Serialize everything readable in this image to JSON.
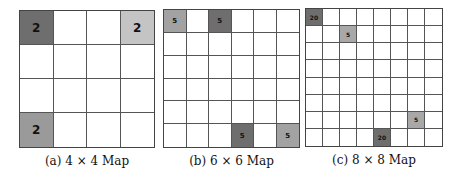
{
  "panels": [
    {
      "id": "a",
      "caption": "(a) 4 × 4 Map",
      "size": 4,
      "box": {
        "x": 19,
        "y": 10,
        "w": 136,
        "h": 138
      },
      "font_size": 12,
      "cells": [
        {
          "row": 0,
          "col": 0,
          "value": "2",
          "color": "#6e6e6e"
        },
        {
          "row": 0,
          "col": 3,
          "value": "2",
          "color": "#c4c4c4"
        },
        {
          "row": 3,
          "col": 0,
          "value": "2",
          "color": "#9a9a9a"
        }
      ]
    },
    {
      "id": "b",
      "caption": "(b) 6 × 6 Map",
      "size": 6,
      "box": {
        "x": 163,
        "y": 9,
        "w": 137,
        "h": 139
      },
      "font_size": 7,
      "cells": [
        {
          "row": 0,
          "col": 0,
          "value": "5",
          "color": "#a2a2a2"
        },
        {
          "row": 0,
          "col": 2,
          "value": "5",
          "color": "#6e6e6e"
        },
        {
          "row": 5,
          "col": 3,
          "value": "5",
          "color": "#6e6e6e"
        },
        {
          "row": 5,
          "col": 5,
          "value": "5",
          "color": "#a2a2a2"
        }
      ]
    },
    {
      "id": "c",
      "caption": "(c) 8 × 8 Map",
      "size": 8,
      "box": {
        "x": 305,
        "y": 8,
        "w": 138,
        "h": 139
      },
      "font_size": 6,
      "cells": [
        {
          "row": 0,
          "col": 0,
          "value": "20",
          "color": "#6e6e6e"
        },
        {
          "row": 1,
          "col": 2,
          "value": "5",
          "color": "#a8a8a8"
        },
        {
          "row": 6,
          "col": 6,
          "value": "5",
          "color": "#a8a8a8"
        },
        {
          "row": 7,
          "col": 4,
          "value": "20",
          "color": "#6e6e6e"
        }
      ]
    }
  ]
}
